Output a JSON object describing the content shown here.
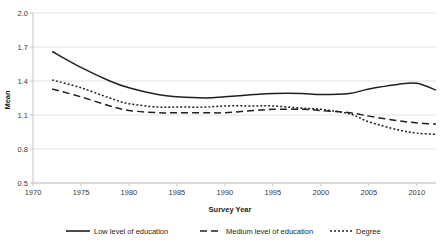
{
  "chart_data": {
    "type": "line",
    "title": "",
    "xlabel": "Survey Year",
    "ylabel": "Mean",
    "xlim": [
      1970,
      2012
    ],
    "ylim": [
      0.5,
      2.0
    ],
    "yticks": [
      "0.5",
      "0.8",
      "1.1",
      "1.4",
      "1.7",
      "2.0"
    ],
    "ytick_values": [
      0.5,
      0.8,
      1.1,
      1.4,
      1.7,
      2.0
    ],
    "xticks": [
      "1970",
      "1975",
      "1980",
      "1985",
      "1990",
      "1995",
      "2000",
      "2005",
      "2010"
    ],
    "xtick_values": [
      1970,
      1975,
      1980,
      1985,
      1990,
      1995,
      2000,
      2005,
      2010
    ],
    "grid": true,
    "legend_position": "bottom",
    "x": [
      1972,
      1975,
      1978,
      1980,
      1983,
      1985,
      1988,
      1990,
      1993,
      1995,
      1998,
      2000,
      2003,
      2005,
      2008,
      2010,
      2012
    ],
    "series": [
      {
        "name": "Low level of education",
        "style": "solid",
        "values": [
          1.66,
          1.52,
          1.4,
          1.34,
          1.28,
          1.26,
          1.25,
          1.26,
          1.28,
          1.29,
          1.29,
          1.28,
          1.29,
          1.33,
          1.37,
          1.38,
          1.32
        ]
      },
      {
        "name": "Medium level of education",
        "style": "dashed",
        "values": [
          1.33,
          1.26,
          1.18,
          1.14,
          1.12,
          1.12,
          1.12,
          1.12,
          1.14,
          1.15,
          1.15,
          1.14,
          1.12,
          1.09,
          1.05,
          1.03,
          1.02
        ]
      },
      {
        "name": "Degree",
        "style": "dotted",
        "values": [
          1.41,
          1.34,
          1.25,
          1.2,
          1.17,
          1.17,
          1.17,
          1.18,
          1.18,
          1.18,
          1.16,
          1.15,
          1.11,
          1.04,
          0.97,
          0.94,
          0.93
        ]
      }
    ]
  },
  "legend": {
    "items": [
      {
        "label": "Low level of education"
      },
      {
        "label": "Medium level of education"
      },
      {
        "label": "Degree"
      }
    ]
  },
  "colors": {
    "line": "#231f20",
    "grid": "#d9d9d9",
    "axis": "#bfbfbf",
    "background": "#ffffff"
  }
}
